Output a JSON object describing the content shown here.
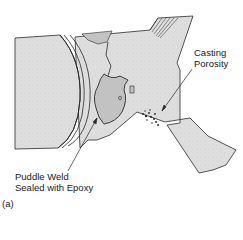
{
  "figure": {
    "panel_label": "(a)",
    "annotations": [
      {
        "id": "casting-porosity",
        "lines": [
          "Casting",
          "Porosity"
        ]
      },
      {
        "id": "puddle-weld",
        "lines": [
          "Puddle Weld",
          "Sealed with Epoxy"
        ]
      }
    ]
  },
  "colors": {
    "casting_fill": "#dcdcdc",
    "weld_fill": "#c2c2c2",
    "outline": "#2a2a2a",
    "background": "#ffffff"
  }
}
